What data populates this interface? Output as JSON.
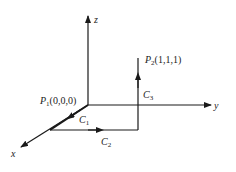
{
  "diagram": {
    "type": "3d-coordinate-path",
    "axes": {
      "x": {
        "label": "x"
      },
      "y": {
        "label": "y"
      },
      "z": {
        "label": "z"
      }
    },
    "points": {
      "p1": {
        "name": "P",
        "sub": "1",
        "coords": "(0,0,0)"
      },
      "p2": {
        "name": "P",
        "sub": "2",
        "coords": "(1,1,1)"
      }
    },
    "paths": {
      "c1": {
        "name": "C",
        "sub": "1"
      },
      "c2": {
        "name": "C",
        "sub": "2"
      },
      "c3": {
        "name": "C",
        "sub": "3"
      }
    },
    "colors": {
      "line": "#1a1a1a",
      "background": "#ffffff"
    }
  }
}
